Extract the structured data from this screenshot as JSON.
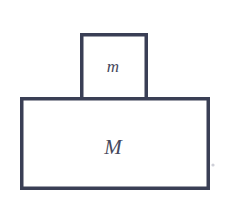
{
  "figure": {
    "kind": "physics-free-body-diagram",
    "width": 238,
    "height": 213,
    "background_color": "#ffffff",
    "stroke_color": "#3a3f55",
    "stroke_width": 3.5,
    "label_color": "#46485c"
  },
  "blocks": {
    "small": {
      "label": "m",
      "name": "small-block",
      "x": 80,
      "y": 33,
      "width": 68,
      "height": 64,
      "open_bottom": true,
      "label_x": 113,
      "label_y": 72
    },
    "large": {
      "label": "M",
      "name": "large-block",
      "x": 20,
      "y": 97,
      "width": 190,
      "height": 93,
      "open_bottom": false,
      "label_x": 113,
      "label_y": 154
    }
  },
  "artifact": {
    "name": "scan-speck",
    "x": 213,
    "y": 165,
    "r": 1.6
  }
}
